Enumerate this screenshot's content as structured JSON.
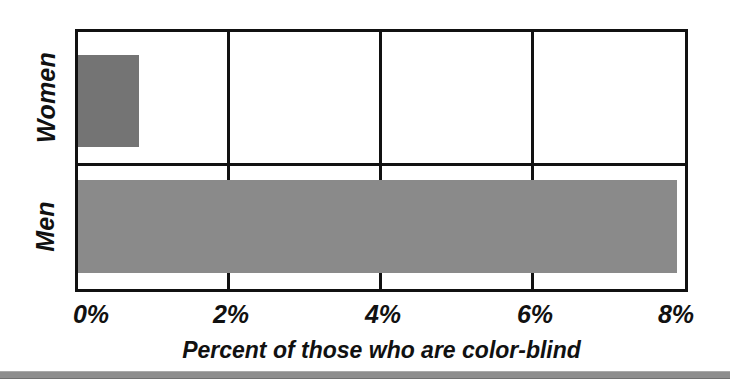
{
  "chart_data": {
    "type": "bar",
    "orientation": "horizontal",
    "title": "",
    "xlabel": "Percent of those who are color-blind",
    "ylabel": "",
    "categories": [
      "Women",
      "Men"
    ],
    "values": [
      0.8,
      7.9
    ],
    "value_unit": "%",
    "xlim": [
      0,
      8
    ],
    "xticks": [
      0,
      2,
      4,
      6,
      8
    ],
    "xtick_labels": [
      "0%",
      "2%",
      "4%",
      "6%",
      "8%"
    ],
    "grid": true,
    "grid_axis": "x",
    "legend": false,
    "legend_position": "none",
    "series": [
      {
        "name": "Percent color-blind",
        "values": [
          0.8,
          7.9
        ]
      }
    ],
    "bar_colors": [
      "#747474",
      "#8a8a8a"
    ],
    "frame_color": "#111111",
    "background_color": "#ffffff",
    "annotations": []
  },
  "axes": {
    "y_categories": [
      {
        "label": "Women",
        "value": 0.8
      },
      {
        "label": "Men",
        "value": 7.9
      }
    ],
    "x_ticks": [
      {
        "label": "0%",
        "value": 0
      },
      {
        "label": "2%",
        "value": 2
      },
      {
        "label": "4%",
        "value": 4
      },
      {
        "label": "6%",
        "value": 6
      },
      {
        "label": "8%",
        "value": 8
      }
    ],
    "x_title": "Percent of those who are color-blind"
  },
  "colors": {
    "bar_women": "#747474",
    "bar_men": "#8a8a8a",
    "frame": "#111111",
    "page_background": "#ffffff",
    "footer_rule": "#8e8e8e"
  }
}
